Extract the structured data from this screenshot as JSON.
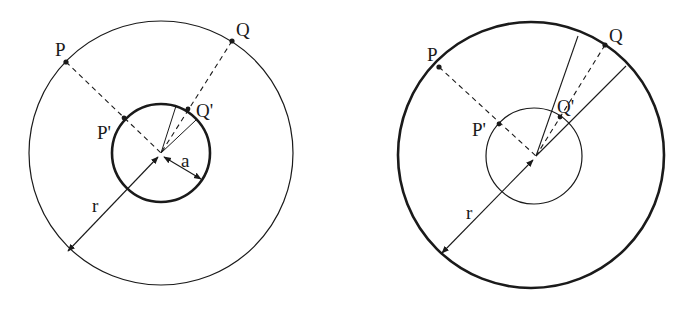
{
  "figure": {
    "panels": [
      {
        "id": "left",
        "thick_circle": "inner",
        "labels": {
          "P": "P",
          "Q": "Q",
          "P_prime": "P'",
          "Q_prime": "Q'",
          "r": "r",
          "a": "a"
        },
        "shows_radius_a": true
      },
      {
        "id": "right",
        "thick_circle": "outer",
        "labels": {
          "P": "P",
          "Q": "Q",
          "P_prime": "P'",
          "Q_prime": "Q'",
          "r": "r"
        },
        "shows_radius_a": false
      }
    ]
  },
  "colors": {
    "ink": "#1a1a1a",
    "background": "#ffffff"
  }
}
